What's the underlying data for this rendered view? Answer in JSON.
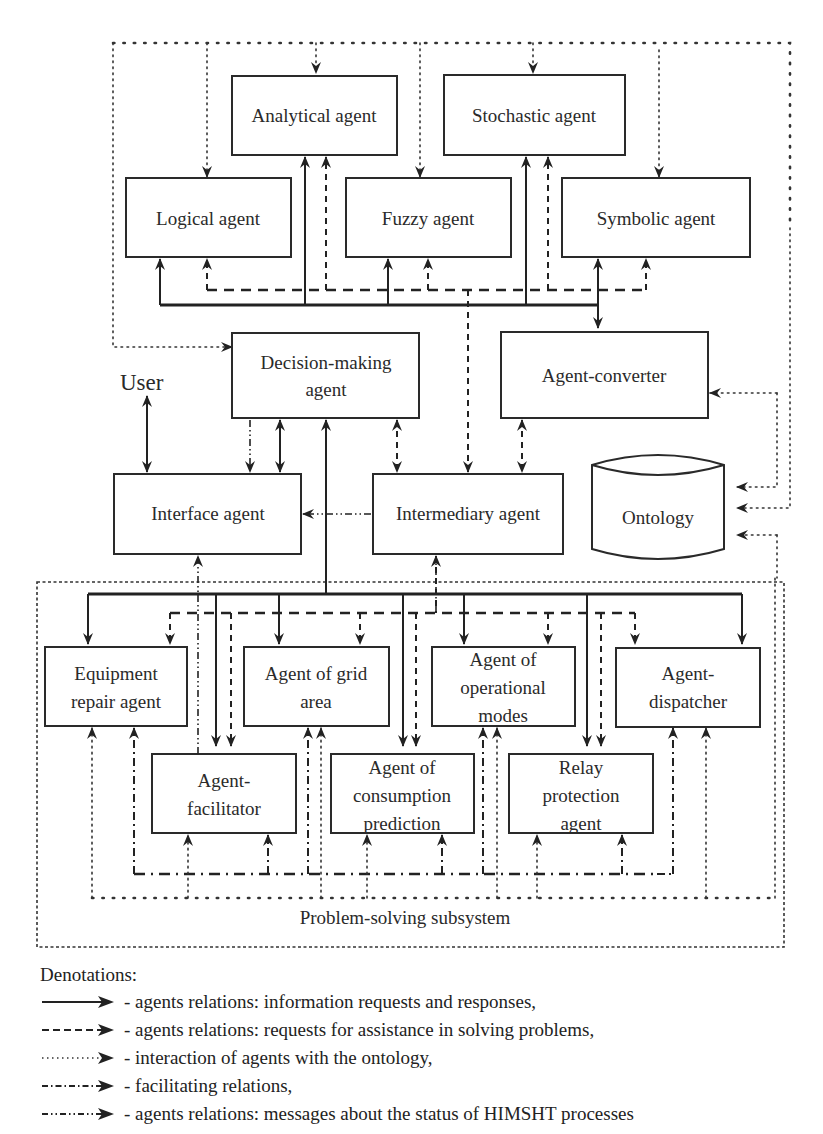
{
  "diagram": {
    "title_fragment": "",
    "user_label": "User",
    "subsystem_label": "Problem-solving subsystem",
    "agents": {
      "analytical": "Analytical agent",
      "stochastic": "Stochastic agent",
      "logical": "Logical agent",
      "fuzzy": "Fuzzy agent",
      "symbolic": "Symbolic agent",
      "decision_making": [
        "Decision-making",
        "agent"
      ],
      "agent_converter": "Agent-converter",
      "interface": "Interface agent",
      "intermediary": "Intermediary agent",
      "ontology": "Ontology",
      "equipment_repair": [
        "Equipment",
        "repair agent"
      ],
      "grid_area": [
        "Agent of grid",
        "area"
      ],
      "operational_modes": [
        "Agent of",
        "operational",
        "modes"
      ],
      "dispatcher": [
        "Agent-",
        "dispatcher"
      ],
      "facilitator": [
        "Agent-",
        "facilitator"
      ],
      "consumption_prediction": [
        "Agent of",
        "consumption",
        "prediction"
      ],
      "relay_protection": [
        "Relay",
        "protection",
        "agent"
      ]
    }
  },
  "legend": {
    "title": "Denotations:",
    "items": [
      {
        "style": "solid",
        "text": "- agents relations: information requests and responses,"
      },
      {
        "style": "dashed",
        "text": "- agents relations: requests for assistance in solving problems,"
      },
      {
        "style": "dotted",
        "text": "- interaction of agents with the ontology,"
      },
      {
        "style": "dash-dot",
        "text": "- facilitating relations,"
      },
      {
        "style": "dash-dot-dot",
        "text": "- agents relations: messages about the status of HIMSHT processes"
      }
    ]
  },
  "colors": {
    "line": "#222222",
    "background": "#ffffff"
  }
}
